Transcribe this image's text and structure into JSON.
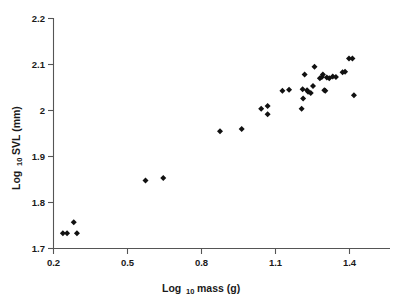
{
  "chart_data": {
    "type": "scatter",
    "title": "",
    "subtitle": "",
    "xlabel": "Log 10 mass (g)",
    "xlabel_main": "Log",
    "xlabel_sub": "10",
    "xlabel_tail": "mass (g)",
    "ylabel": "Log 10 SVL (mm)",
    "ylabel_main": "Log",
    "ylabel_sub": "10",
    "ylabel_tail": "SVL (mm)",
    "xlim": [
      0.2,
      1.5
    ],
    "ylim": [
      1.7,
      2.2
    ],
    "xticks": [
      0.2,
      0.5,
      0.8,
      1.1,
      1.4
    ],
    "yticks": [
      1.7,
      1.8,
      1.9,
      2.0,
      2.1,
      2.2
    ],
    "xtick_labels": [
      "0.2",
      "0.5",
      "0.8",
      "1.1",
      "1.4"
    ],
    "ytick_labels": [
      "1.7",
      "1.8",
      "1.9",
      "2",
      "2.1",
      "2.2"
    ],
    "grid": false,
    "legend": null,
    "marker": "diamond",
    "marker_color": "#111111",
    "series": [
      {
        "name": "specimens",
        "points": [
          [
            0.238,
            1.733
          ],
          [
            0.255,
            1.733
          ],
          [
            0.282,
            1.757
          ],
          [
            0.295,
            1.733
          ],
          [
            0.573,
            1.848
          ],
          [
            0.645,
            1.853
          ],
          [
            0.875,
            1.955
          ],
          [
            0.963,
            1.96
          ],
          [
            1.042,
            2.004
          ],
          [
            1.068,
            2.01
          ],
          [
            1.068,
            1.992
          ],
          [
            1.128,
            2.043
          ],
          [
            1.155,
            2.045
          ],
          [
            1.206,
            2.004
          ],
          [
            1.21,
            2.046
          ],
          [
            1.212,
            2.026
          ],
          [
            1.218,
            2.078
          ],
          [
            1.228,
            2.044
          ],
          [
            1.232,
            2.041
          ],
          [
            1.243,
            2.038
          ],
          [
            1.252,
            2.053
          ],
          [
            1.258,
            2.095
          ],
          [
            1.28,
            2.07
          ],
          [
            1.288,
            2.073
          ],
          [
            1.292,
            2.078
          ],
          [
            1.298,
            2.044
          ],
          [
            1.302,
            2.043
          ],
          [
            1.308,
            2.072
          ],
          [
            1.318,
            2.07
          ],
          [
            1.332,
            2.074
          ],
          [
            1.345,
            2.073
          ],
          [
            1.372,
            2.083
          ],
          [
            1.382,
            2.084
          ],
          [
            1.398,
            2.113
          ],
          [
            1.412,
            2.113
          ],
          [
            1.418,
            2.033
          ]
        ]
      }
    ]
  },
  "axes": {
    "x_axis_name": "x-axis",
    "y_axis_name": "y-axis"
  }
}
